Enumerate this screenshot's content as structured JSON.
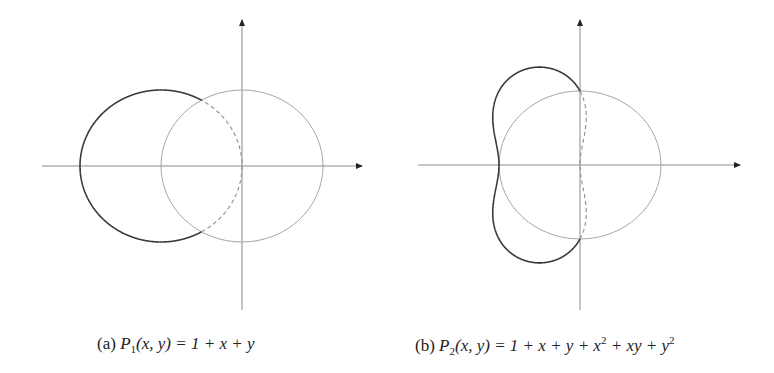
{
  "figure": {
    "panels": [
      {
        "id": "a",
        "label": "(a)",
        "caption_poly_name": "P",
        "caption_poly_sub": "1",
        "caption_args": "(x, y)",
        "caption_rhs": "= 1 + x + y",
        "polynomial_coeffs": [
          1,
          1
        ],
        "origin_px": [
          242,
          166
        ],
        "scale_px": [
          81,
          76
        ],
        "x_axis_px": [
          42,
          362
        ],
        "y_axis_px": [
          20,
          310
        ]
      },
      {
        "id": "b",
        "label": "(b)",
        "caption_poly_name": "P",
        "caption_poly_sub": "2",
        "caption_args": "(x, y)",
        "caption_rhs_parts": [
          "= 1 + x + y + x",
          "2",
          " + xy + y",
          "2"
        ],
        "polynomial_coeffs": [
          1,
          1,
          1
        ],
        "origin_px": [
          580,
          165
        ],
        "scale_px": [
          81,
          74
        ],
        "x_axis_px": [
          418,
          740
        ],
        "y_axis_px": [
          20,
          310
        ]
      }
    ],
    "styles": {
      "axis_color": "#8a8a8a",
      "unit_circle_color": "#a6a6a6",
      "curve_color": "#3a3a3a",
      "dashed_color": "#8c8c8c"
    }
  },
  "chart_data": [
    {
      "type": "line",
      "title": "(a) P1(x, y) = 1 + x + y",
      "description": "Level set |P1(z)| = 1 (circle centered at (-1,0), radius 1) with unit circle; solid outside unit disk, dashed inside",
      "xlim": [
        -2.5,
        1.5
      ],
      "ylim": [
        -1.9,
        1.9
      ],
      "series": [
        {
          "name": "unit circle",
          "center": [
            0,
            0
          ],
          "radius": 1,
          "style": "thin gray"
        },
        {
          "name": "|1+z| = 1",
          "center": [
            -1,
            0
          ],
          "radius": 1,
          "style": "solid dark outside unit disk, dashed inside"
        }
      ],
      "key_points": [
        [
          -2,
          0
        ],
        [
          0,
          0
        ],
        [
          -0.5,
          0.866
        ],
        [
          -0.5,
          -0.866
        ]
      ],
      "grid": false,
      "legend": null
    },
    {
      "type": "line",
      "title": "(b) P2(x, y) = 1 + x + y + x^2 + xy + y^2",
      "description": "Level set |1 + z + z^2| = 1 with unit circle; solid outside unit disk, dashed inside",
      "xlim": [
        -2.0,
        2.0
      ],
      "ylim": [
        -1.9,
        1.9
      ],
      "series": [
        {
          "name": "unit circle",
          "center": [
            0,
            0
          ],
          "radius": 1,
          "style": "thin gray"
        },
        {
          "name": "|1+z+z^2| = 1",
          "style": "solid dark outside unit disk, dashed inside"
        }
      ],
      "key_points": [
        [
          -1,
          0
        ],
        [
          0,
          1
        ],
        [
          0,
          -1
        ],
        [
          0,
          0
        ]
      ],
      "grid": false,
      "legend": null
    }
  ]
}
